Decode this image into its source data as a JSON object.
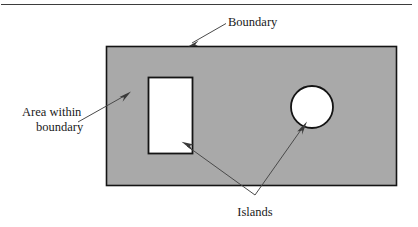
{
  "figure": {
    "background_color": "#ffffff",
    "top_rule": {
      "present": true,
      "color": "#3d3d3d"
    }
  },
  "labels": {
    "boundary": "Boundary",
    "area_within_line1": "Area within",
    "area_within_line2": "boundary",
    "islands": "Islands"
  },
  "shapes": {
    "outer_rectangle": {
      "name": "boundary-region",
      "fill_color": "#a9a9a9",
      "stroke_color": "#141414",
      "x": 106,
      "y": 46,
      "width": 290,
      "height": 139
    },
    "island_rectangle": {
      "name": "rectangular-island",
      "fill_color": "#ffffff",
      "stroke_color": "#141414",
      "x": 148,
      "y": 77,
      "width": 44,
      "height": 76
    },
    "island_circle": {
      "name": "circular-island",
      "fill_color": "#ffffff",
      "stroke_color": "#141414",
      "cx": 312,
      "cy": 107,
      "r": 21
    }
  },
  "leaders": {
    "boundary": {
      "from_x": 226,
      "from_y": 24,
      "to_x": 190,
      "to_y": 45
    },
    "area_within": {
      "from_x": 80,
      "from_y": 121,
      "to_x": 128,
      "to_y": 94
    },
    "islands_apex": {
      "x": 255,
      "y": 196
    },
    "islands_left_tip": {
      "x": 183,
      "y": 143
    },
    "islands_right_tip": {
      "x": 300,
      "y": 124
    }
  }
}
